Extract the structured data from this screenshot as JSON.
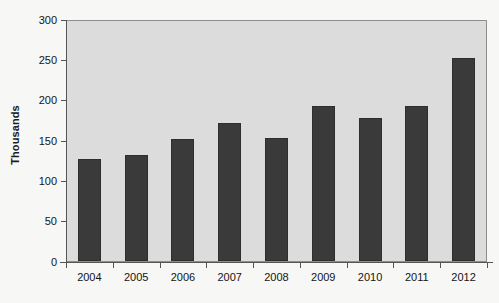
{
  "chart_data": {
    "type": "bar",
    "title": "",
    "subtitle": "",
    "xlabel": "",
    "ylabel": "Thousands",
    "categories": [
      "2004",
      "2005",
      "2006",
      "2007",
      "2008",
      "2009",
      "2010",
      "2011",
      "2012"
    ],
    "values": [
      126,
      131,
      151,
      171,
      152,
      192,
      177,
      192,
      252
    ],
    "ylim": [
      0,
      300
    ],
    "y_ticks": [
      0,
      50,
      100,
      150,
      200,
      250,
      300
    ],
    "y_tick_labels": [
      "0",
      "50",
      "100",
      "150",
      "200",
      "250",
      "300"
    ],
    "grid": false,
    "legend": null,
    "legend_position": "none",
    "annotations": [],
    "colors": {
      "bar": "#3a3a3a",
      "bar_border": "#2e2e2e",
      "plot_background": "#dcdcdc",
      "plot_border": "#8e8e8e",
      "page_background": "#f7f7f6",
      "axis_line": "#555555",
      "tick_text": "#141414",
      "axis_title_text": "#1c1c1c"
    }
  }
}
